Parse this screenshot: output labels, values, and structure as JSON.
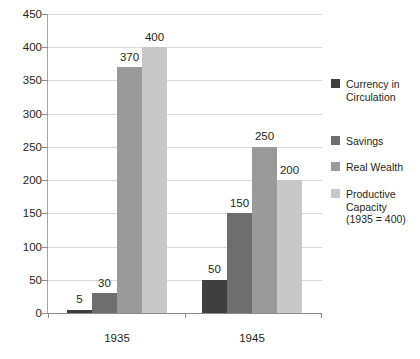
{
  "chart_data": {
    "type": "bar",
    "title": "",
    "subtitle": "",
    "xlabel": "",
    "ylabel": "",
    "categories": [
      "1935",
      "1945"
    ],
    "ylim": [
      0,
      450
    ],
    "yticks": [
      0,
      50,
      100,
      150,
      200,
      250,
      300,
      350,
      400,
      450
    ],
    "ytick_labels": [
      "0",
      "50",
      "100",
      "150",
      "200",
      "250",
      "300",
      "350",
      "400",
      "450"
    ],
    "grid": true,
    "legend_position": "right",
    "show_data_labels": true,
    "series": [
      {
        "name": "Currency in Circulation",
        "legend_label_lines": [
          "Currency in",
          "Circulation"
        ],
        "color": "#3f3f3f",
        "values": [
          5,
          50
        ],
        "value_labels": [
          "5",
          "50"
        ]
      },
      {
        "name": "Savings",
        "legend_label_lines": [
          "Savings"
        ],
        "color": "#6e6e6e",
        "values": [
          30,
          150
        ],
        "value_labels": [
          "30",
          "150"
        ]
      },
      {
        "name": "Real Wealth",
        "legend_label_lines": [
          "Real Wealth"
        ],
        "color": "#9a9a9a",
        "values": [
          370,
          250
        ],
        "value_labels": [
          "370",
          "250"
        ]
      },
      {
        "name": "Productive Capacity (1935 = 400)",
        "legend_label_lines": [
          "Productive",
          "Capacity",
          "(1935 = 400)"
        ],
        "color": "#c8c8c8",
        "values": [
          400,
          200
        ],
        "value_labels": [
          "400",
          "200"
        ]
      }
    ]
  },
  "colors": {
    "background": "#ffffff",
    "text": "#231f20",
    "gridline": "#d9d9d9",
    "axis": "#8c8c8c"
  }
}
